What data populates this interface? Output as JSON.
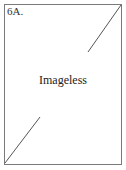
{
  "placeholder": {
    "label": "6A.",
    "text": "Imageless",
    "border_color": "#7a7a7a",
    "line_color": "#555555"
  }
}
